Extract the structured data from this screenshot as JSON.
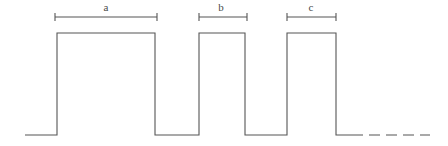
{
  "figure": {
    "type": "waveform-diagram",
    "width": 448,
    "height": 146,
    "background_color": "#ffffff",
    "stroke_color": "#555555",
    "stroke_width": 1.1
  },
  "chart_data": {
    "type": "line",
    "title": "",
    "xlabel": "",
    "ylabel": "",
    "grid": false,
    "legend": "none",
    "baseline_y": 135,
    "high_y": 33,
    "trace_start_x": 25,
    "trace_end_x": 430,
    "pulses": [
      {
        "id": "pulse-1",
        "rise_x": 57,
        "fall_x": 155,
        "width": 98
      },
      {
        "id": "pulse-2",
        "rise_x": 199,
        "fall_x": 245,
        "width": 46
      },
      {
        "id": "pulse-3",
        "rise_x": 287,
        "fall_x": 336,
        "width": 49
      }
    ],
    "low_segments": [
      {
        "id": "low-lead",
        "x1": 25,
        "x2": 57
      },
      {
        "id": "low-gap-1",
        "x1": 155,
        "x2": 199
      },
      {
        "id": "low-gap-2",
        "x1": 245,
        "x2": 287
      },
      {
        "id": "low-tail-solid",
        "x1": 336,
        "x2": 352
      }
    ],
    "dashed_tail": {
      "x1": 352,
      "x2": 430,
      "y": 135,
      "dash_pattern": "11 6"
    },
    "waveform_path": "M25,135 L57,135 L57,33 L155,33 L155,135 L199,135 L199,33 L245,33 L245,135 L287,135 L287,33 L336,33 L336,135 L352,135"
  },
  "dimensions": {
    "line_y": 17,
    "tick_half_height": 4,
    "label_y": 11,
    "items": [
      {
        "name": "dimension-a",
        "label": "a",
        "x1": 55,
        "x2": 157,
        "label_x": 106,
        "measures": "pulse-1"
      },
      {
        "name": "dimension-b",
        "label": "b",
        "x1": 199,
        "x2": 247,
        "label_x": 221,
        "measures": "pulse-2"
      },
      {
        "name": "dimension-c",
        "label": "c",
        "x1": 287,
        "x2": 336,
        "label_x": 311,
        "measures": "pulse-3"
      }
    ]
  }
}
